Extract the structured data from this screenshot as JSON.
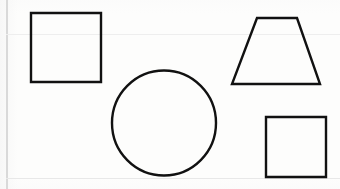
{
  "document": {
    "kind": "scanned-worksheet",
    "title": "Geometric Shapes",
    "background_color": "#fdfdfc",
    "ink_color": "#111111",
    "rule_color": "#dedede",
    "width": 340,
    "height": 189
  },
  "guides": {
    "margin_line": {
      "name": "left-margin-rule",
      "orientation": "vertical",
      "x": 6,
      "y": 0,
      "length": 189,
      "thickness": 2,
      "color": "#d9d9d9"
    },
    "horizontal_rules": [
      {
        "name": "upper-rule",
        "orientation": "horizontal",
        "x": 6,
        "y": 34,
        "length": 334,
        "thickness": 1,
        "color": "#eeeeee"
      },
      {
        "name": "lower-rule",
        "orientation": "horizontal",
        "x": 6,
        "y": 178,
        "length": 334,
        "thickness": 1,
        "color": "#e8e8e8"
      }
    ]
  },
  "shapes": [
    {
      "id": "shape-square-top-left",
      "label": "Square",
      "type": "square",
      "stroke": "#111111",
      "stroke_width": 2.4,
      "fill": "none",
      "x": 31,
      "y": 13,
      "width": 70,
      "height": 69,
      "points": "31,13 101,13 101,82 31,82",
      "sides": 4,
      "vertices": 4
    },
    {
      "id": "shape-circle-center",
      "label": "Circle",
      "type": "circle",
      "stroke": "#111111",
      "stroke_width": 2.4,
      "fill": "none",
      "cx": 164,
      "cy": 123,
      "rx": 52,
      "ry": 52.5,
      "diameter": 104,
      "sides": 0,
      "vertices": 0
    },
    {
      "id": "shape-trapezoid-top-right",
      "label": "Trapezoid",
      "type": "trapezoid",
      "stroke": "#111111",
      "stroke_width": 2.4,
      "fill": "none",
      "points": "257,18 297,18 320,84 232,84",
      "top_width": 40,
      "bottom_width": 88,
      "height": 66,
      "sides": 4,
      "vertices": 4
    },
    {
      "id": "shape-square-bottom-right",
      "label": "Square",
      "type": "square",
      "stroke": "#111111",
      "stroke_width": 2.4,
      "fill": "none",
      "x": 266,
      "y": 117,
      "width": 60,
      "height": 60,
      "points": "266,117 326,117 326,177 266,177",
      "sides": 4,
      "vertices": 4
    }
  ],
  "counts": {
    "total_shapes": 4,
    "squares": 2,
    "circles": 1,
    "trapezoids": 1
  }
}
